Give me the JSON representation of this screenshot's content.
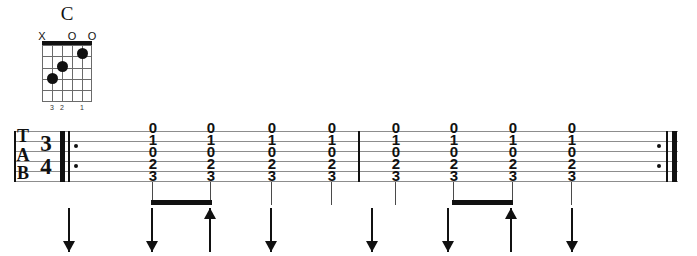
{
  "chord": {
    "name": "C",
    "strings": 6,
    "frets": 5,
    "open_mute_markers": [
      "X",
      "",
      "",
      "O",
      "",
      "O"
    ],
    "dots": [
      {
        "string": 5,
        "fret": 3
      },
      {
        "string": 4,
        "fret": 2
      },
      {
        "string": 2,
        "fret": 1
      }
    ],
    "finger_numbers": [
      "",
      "3",
      "2",
      "",
      "1",
      ""
    ]
  },
  "tab": {
    "clef": [
      "T",
      "A",
      "B"
    ],
    "time_signature": {
      "beats": "3",
      "unit": "4"
    },
    "lines": 6,
    "start_repeat": true,
    "end_repeat": true,
    "measures": [
      {
        "notes": [
          {
            "frets": [
              "0",
              "1",
              "0",
              "2",
              "3"
            ]
          },
          {
            "frets": [
              "0",
              "1",
              "0",
              "2",
              "3"
            ]
          },
          {
            "frets": [
              "0",
              "1",
              "0",
              "2",
              "3"
            ]
          },
          {
            "frets": [
              "0",
              "1",
              "0",
              "2",
              "3"
            ]
          }
        ],
        "beam_pairs": [
          [
            1,
            2
          ]
        ]
      },
      {
        "notes": [
          {
            "frets": [
              "0",
              "1",
              "0",
              "2",
              "3"
            ]
          },
          {
            "frets": [
              "0",
              "1",
              "0",
              "2",
              "3"
            ]
          },
          {
            "frets": [
              "0",
              "1",
              "0",
              "2",
              "3"
            ]
          },
          {
            "frets": [
              "0",
              "1",
              "0",
              "2",
              "3"
            ]
          }
        ],
        "beam_pairs": [
          [
            1,
            2
          ]
        ]
      }
    ]
  },
  "strum_pattern": {
    "directions": [
      "down",
      "down",
      "up",
      "down",
      "down",
      "down",
      "up",
      "down"
    ]
  }
}
